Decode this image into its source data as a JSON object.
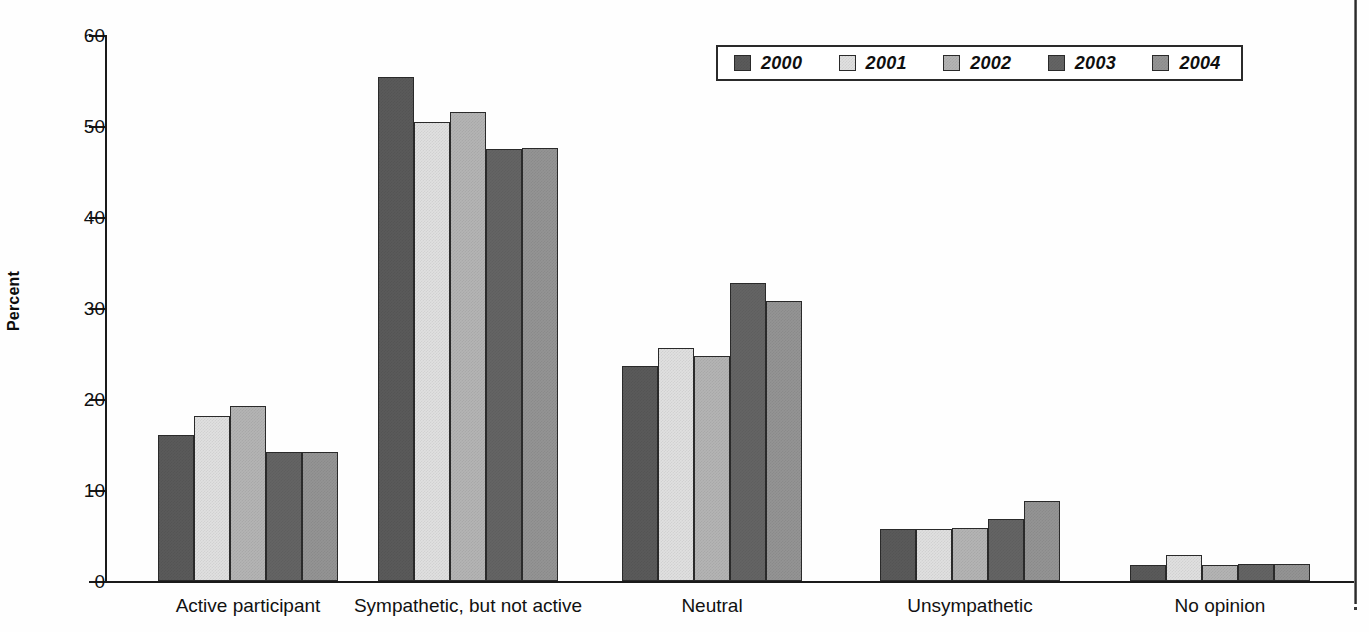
{
  "chart_data": {
    "type": "bar",
    "title": "",
    "subtitle": "",
    "xlabel": "",
    "ylabel": "Percent",
    "ylim": [
      0,
      60
    ],
    "yticks": [
      0,
      10,
      20,
      30,
      40,
      50,
      60
    ],
    "grid": false,
    "legend_position": "top-right",
    "categories": [
      "Active participant",
      "Sympathetic, but not active",
      "Neutral",
      "Unsympathetic",
      "No opinion"
    ],
    "series": [
      {
        "name": "2000",
        "color": "#5a5a5a",
        "values": [
          16.1,
          55.4,
          23.6,
          5.7,
          1.8
        ]
      },
      {
        "name": "2001",
        "color": "#e0e0e0",
        "values": [
          18.1,
          50.4,
          25.6,
          5.7,
          2.9
        ]
      },
      {
        "name": "2002",
        "color": "#b4b4b4",
        "values": [
          19.2,
          51.5,
          24.7,
          5.8,
          1.8
        ]
      },
      {
        "name": "2003",
        "color": "#646464",
        "values": [
          14.2,
          47.5,
          32.8,
          6.8,
          1.9
        ]
      },
      {
        "name": "2004",
        "color": "#949494",
        "values": [
          14.2,
          47.6,
          30.8,
          8.8,
          1.9
        ]
      }
    ]
  },
  "legend": {
    "items": [
      {
        "label": "2000"
      },
      {
        "label": "2001"
      },
      {
        "label": "2002"
      },
      {
        "label": "2003"
      },
      {
        "label": "2004"
      }
    ]
  },
  "axes": {
    "y_title": "Percent",
    "y_tick_labels": [
      "0",
      "10",
      "20",
      "30",
      "40",
      "50",
      "60"
    ]
  }
}
